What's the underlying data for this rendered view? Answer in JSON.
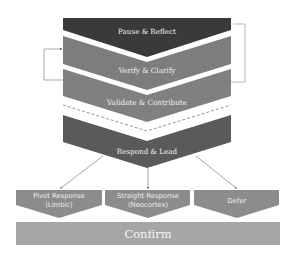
{
  "diagram": {
    "stages": [
      {
        "label": "Pause & Reflect",
        "color": "#3a3a3a"
      },
      {
        "label": "Verify & Clarify",
        "color": "#7d7d7d"
      },
      {
        "label": "Validate & Contribute",
        "color": "#808080"
      },
      {
        "label": "Respond & Lead",
        "color": "#5a5a5a"
      }
    ],
    "outcomes": [
      {
        "line1": "Pivot  Response",
        "line2": "(Limbic)",
        "color": "#8c8c8c"
      },
      {
        "line1": "Straight Response",
        "line2": "(Neocortex)",
        "color": "#8c8c8c"
      },
      {
        "line1": "Defer",
        "line2": "",
        "color": "#8c8c8c"
      }
    ],
    "confirm": {
      "label": "Confirm",
      "color": "#a6a6a6"
    },
    "loops": {
      "left": "Verify & Clarify loops back into Verify & Clarify",
      "right": "Verify & Clarify loops back to Pause & Reflect"
    }
  }
}
